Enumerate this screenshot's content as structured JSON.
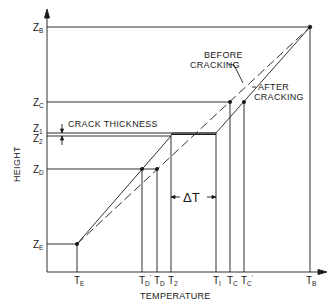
{
  "diagram": {
    "x_axis_label": "TEMPERATURE",
    "y_axis_label": "HEIGHT",
    "annotations": {
      "before_cracking_line1": "BEFORE",
      "before_cracking_line2": "CRACKING",
      "after_cracking_line1": "AFTER",
      "after_cracking_line2": "CRACKING",
      "crack_thickness": "CRACK THICKNESS",
      "delta_t": "ΔT"
    },
    "y_ticks": [
      {
        "main": "Z",
        "sub": "B"
      },
      {
        "main": "Z",
        "sub": "C"
      },
      {
        "main": "Z",
        "sub": "1"
      },
      {
        "main": "Z",
        "sub": "2"
      },
      {
        "main": "Z",
        "sub": "D"
      },
      {
        "main": "Z",
        "sub": "E"
      }
    ],
    "x_ticks": [
      {
        "main": "T",
        "sub": "E"
      },
      {
        "main": "T",
        "sub": "D",
        "prime": "'"
      },
      {
        "main": "T",
        "sub": "D"
      },
      {
        "main": "T",
        "sub": "2"
      },
      {
        "main": "T",
        "sub": "I"
      },
      {
        "main": "T",
        "sub": "C"
      },
      {
        "main": "T",
        "sub": "C",
        "prime": "'"
      },
      {
        "main": "T",
        "sub": "B"
      }
    ],
    "colors": {
      "line": "#1a1a1a",
      "background": "#ffffff"
    }
  }
}
